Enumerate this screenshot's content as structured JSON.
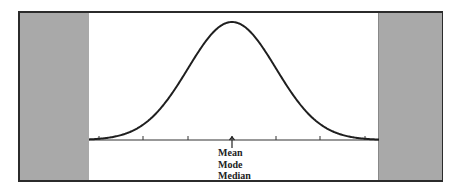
{
  "figure": {
    "center_labels": [
      "Mean",
      "Mode",
      "Median"
    ],
    "colors": {
      "panel": "#a9a9a9",
      "curve": "#1f1f1f",
      "frame": "#2b2b2b"
    }
  },
  "chart_data": {
    "type": "line",
    "title": "",
    "xlabel": "",
    "ylabel": "",
    "x": [
      -3,
      -2,
      -1,
      0,
      1,
      2,
      3
    ],
    "values": [
      0.004,
      0.054,
      0.242,
      0.399,
      0.242,
      0.054,
      0.004
    ],
    "tick_count": 7,
    "annotations": [
      {
        "x": 0,
        "text": "Mean / Mode / Median",
        "arrow": "up"
      }
    ],
    "grid": false
  }
}
